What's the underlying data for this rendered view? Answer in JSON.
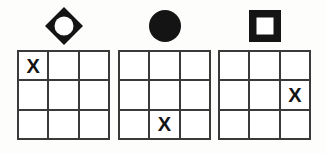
{
  "board": {
    "title": "Three-by-three grid puzzle with shape headers",
    "grid_size": 3,
    "mark_symbol": "X",
    "empty_symbol": "",
    "colors": {
      "background": "#fdfdfc",
      "grid_line": "#3a3a3a",
      "cell_fill": "#ffffff",
      "symbol_ink": "#141414",
      "mark_ink": "#141414"
    },
    "panels": [
      {
        "id": "panel-diamond",
        "symbol_name": "diamond-outline-icon",
        "symbol_label": "diamond",
        "symbol_style": "outline",
        "marked_cell": {
          "row": 0,
          "col": 0
        },
        "cells": [
          [
            "X",
            "",
            ""
          ],
          [
            "",
            "",
            ""
          ],
          [
            "",
            "",
            ""
          ]
        ]
      },
      {
        "id": "panel-circle",
        "symbol_name": "circle-filled-icon",
        "symbol_label": "circle",
        "symbol_style": "filled",
        "marked_cell": {
          "row": 2,
          "col": 1
        },
        "cells": [
          [
            "",
            "",
            ""
          ],
          [
            "",
            "",
            ""
          ],
          [
            "",
            "X",
            ""
          ]
        ]
      },
      {
        "id": "panel-square",
        "symbol_name": "square-outline-icon",
        "symbol_label": "square",
        "symbol_style": "outline",
        "marked_cell": {
          "row": 1,
          "col": 2
        },
        "cells": [
          [
            "",
            "",
            ""
          ],
          [
            "",
            "",
            "X"
          ],
          [
            "",
            "",
            ""
          ]
        ]
      }
    ]
  }
}
